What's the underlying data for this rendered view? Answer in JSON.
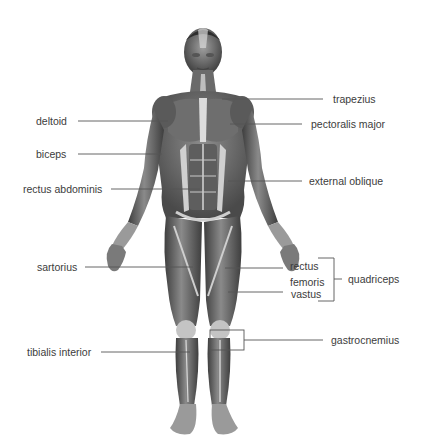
{
  "diagram": {
    "labels_left": [
      {
        "id": "deltoid",
        "text": "deltoid"
      },
      {
        "id": "biceps",
        "text": "biceps"
      },
      {
        "id": "rectus_abdominis",
        "text": "rectus abdominis"
      },
      {
        "id": "sartorius",
        "text": "sartorius"
      },
      {
        "id": "tibialis_interior",
        "text": "tibialis interior"
      }
    ],
    "labels_right": [
      {
        "id": "trapezius",
        "text": "trapezius"
      },
      {
        "id": "pectoralis_major",
        "text": "pectoralis major"
      },
      {
        "id": "external_oblique",
        "text": "external oblique"
      },
      {
        "id": "rectus",
        "text": "rectus"
      },
      {
        "id": "femoris",
        "text": "femoris"
      },
      {
        "id": "vastus",
        "text": "vastus"
      },
      {
        "id": "quadriceps",
        "text": "quadriceps"
      },
      {
        "id": "gastrocnemius",
        "text": "gastrocnemius"
      }
    ],
    "colors": {
      "background": "#ffffff",
      "label_text": "#3c3c3c",
      "leader_line": "#555555",
      "muscle_dark": "#4a4a4a",
      "muscle_mid": "#7a7a7a",
      "muscle_light": "#bdbdbd",
      "tendon": "#e6e6e6"
    }
  }
}
